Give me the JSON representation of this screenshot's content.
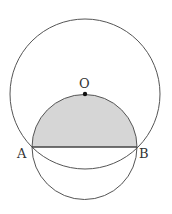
{
  "diagram": {
    "title": "",
    "points": {
      "O": {
        "label": "O",
        "x": 85,
        "y": 94
      },
      "A": {
        "label": "A",
        "x": 32,
        "y": 147
      },
      "B": {
        "label": "B",
        "x": 137,
        "y": 147
      }
    },
    "large_circle": {
      "center": "O",
      "cx": 85,
      "cy": 94,
      "r": 75
    },
    "small_circle": {
      "cx": 84.5,
      "cy": 147,
      "r": 52.5
    },
    "chord": {
      "from": "A",
      "to": "B"
    },
    "shaded_region": "upper semicircle of small circle above chord AB",
    "colors": {
      "stroke": "#555555",
      "shade": "#d6d6d6",
      "point": "#111111"
    }
  }
}
